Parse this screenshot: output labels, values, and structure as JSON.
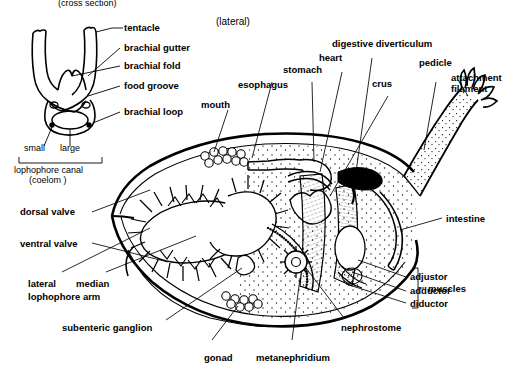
{
  "figure": {
    "title_top_left": "(cross section)",
    "view_label_main": "(lateral)"
  },
  "inset": {
    "name": "lophophore-cross-section",
    "labels": [
      {
        "key": "tentacle",
        "text": "tentacle"
      },
      {
        "key": "brachial_gutter",
        "text": "brachial gutter"
      },
      {
        "key": "brachial_fold",
        "text": "brachial fold"
      },
      {
        "key": "food_groove",
        "text": "food groove"
      },
      {
        "key": "brachial_loop",
        "text": "brachial loop"
      }
    ],
    "canal_small": "small",
    "canal_large": "large",
    "canal_caption_line1": "lophophore canal",
    "canal_caption_line2": "(coelom )"
  },
  "main": {
    "name": "brachiopod-lateral-section",
    "labels_top": [
      {
        "key": "mouth",
        "text": "mouth"
      },
      {
        "key": "esophagus",
        "text": "esophagus"
      },
      {
        "key": "stomach",
        "text": "stomach"
      },
      {
        "key": "heart",
        "text": "heart"
      },
      {
        "key": "digestive_diverticulum",
        "text": "digestive diverticulum"
      },
      {
        "key": "crus",
        "text": "crus"
      },
      {
        "key": "pedicle",
        "text": "pedicle"
      },
      {
        "key": "attachment_filament_l1",
        "text": "attachment"
      },
      {
        "key": "attachment_filament_l2",
        "text": "filament"
      }
    ],
    "labels_left": [
      {
        "key": "dorsal_valve",
        "text": "dorsal valve"
      },
      {
        "key": "ventral_valve",
        "text": "ventral valve"
      },
      {
        "key": "lateral",
        "text": "lateral"
      },
      {
        "key": "median",
        "text": "median"
      },
      {
        "key": "lophophore_arm",
        "text": "lophophore arm"
      },
      {
        "key": "subenteric_ganglion",
        "text": "subenteric ganglion"
      }
    ],
    "labels_bottom": [
      {
        "key": "gonad",
        "text": "gonad"
      },
      {
        "key": "metanephridium",
        "text": "metanephridium"
      },
      {
        "key": "nephrostome",
        "text": "nephrostome"
      }
    ],
    "labels_right": [
      {
        "key": "intestine",
        "text": "intestine"
      },
      {
        "key": "adjustor",
        "text": "adjustor"
      },
      {
        "key": "adductor",
        "text": "adductor"
      },
      {
        "key": "diductor",
        "text": "diductor"
      },
      {
        "key": "muscles",
        "text": "muscles"
      }
    ]
  },
  "colors": {
    "ink": "#000000",
    "paper": "#ffffff"
  }
}
